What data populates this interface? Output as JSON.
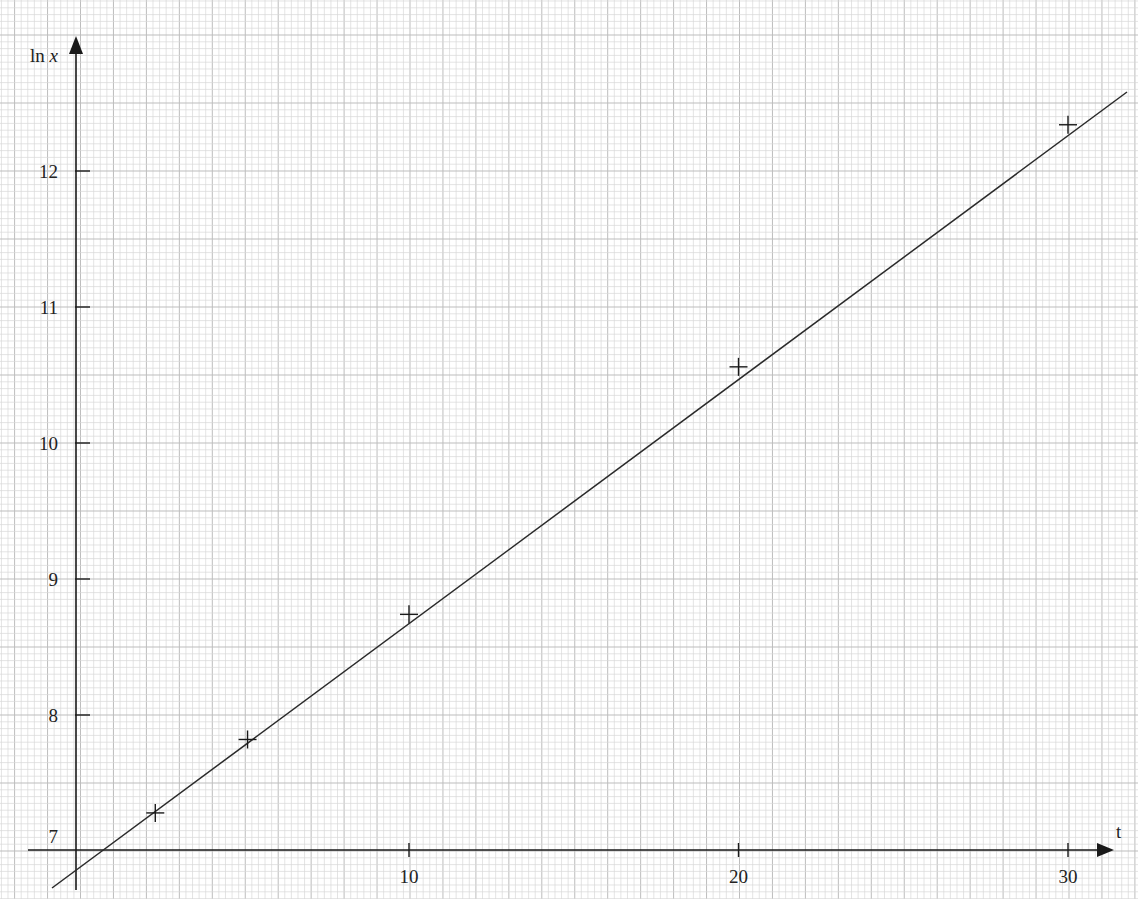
{
  "chart_data": {
    "type": "scatter",
    "title": "",
    "xlabel": "t",
    "ylabel": "ln x",
    "ylabel_parts": {
      "fn": "ln ",
      "var": "x"
    },
    "xlim": [
      -0.15,
      31.5
    ],
    "ylim": [
      6.7,
      12.85
    ],
    "x_ticks": [
      10,
      20,
      30
    ],
    "x_tick_labels": [
      "10",
      "20",
      "30"
    ],
    "y_ticks": [
      7,
      8,
      9,
      10,
      11,
      12
    ],
    "y_tick_labels": [
      "7",
      "8",
      "9",
      "10",
      "11",
      "12"
    ],
    "grid": true,
    "grid_style": "graph paper (minor 0.2 t, 0.1 ln x; major every 1 t / 0.5 ln x)",
    "legend": null,
    "series": [
      {
        "name": "data points",
        "marker": "+",
        "points": [
          {
            "t": 2.3,
            "ln_x": 7.28
          },
          {
            "t": 5.1,
            "ln_x": 7.82
          },
          {
            "t": 10,
            "ln_x": 8.74
          },
          {
            "t": 20,
            "ln_x": 10.56
          },
          {
            "t": 30,
            "ln_x": 12.34
          }
        ]
      },
      {
        "name": "line of best fit",
        "type": "line",
        "points": [
          {
            "t": -0.9,
            "ln_x": 6.74
          },
          {
            "t": 31.8,
            "ln_x": 12.58
          }
        ],
        "approx_gradient": 0.178,
        "approx_intercept": 6.9
      }
    ]
  },
  "colors": {
    "axis": "#1a1a1a",
    "line": "#2a2a2a",
    "marker": "#1a1a1a",
    "grid_minor": "#d9d9d9",
    "grid_major": "#bdbdbd",
    "background": "#ffffff"
  }
}
